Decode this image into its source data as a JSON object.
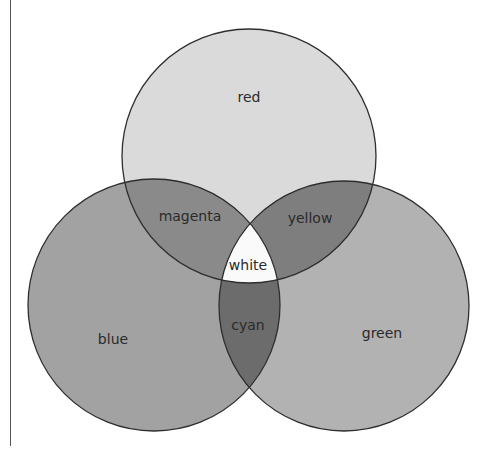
{
  "diagram": {
    "type": "venn",
    "circles": [
      {
        "name": "red",
        "label": "red",
        "cx": 249,
        "cy": 156,
        "r": 127,
        "fill": "#dadada"
      },
      {
        "name": "blue",
        "label": "blue",
        "cx": 154,
        "cy": 305,
        "r": 126,
        "fill": "#a2a2a2"
      },
      {
        "name": "green",
        "label": "green",
        "cx": 344,
        "cy": 306,
        "r": 125,
        "fill": "#b2b2b2"
      }
    ],
    "overlaps": {
      "red_blue": {
        "label": "magenta",
        "fill": "#8a8a8a"
      },
      "red_green": {
        "label": "yellow",
        "fill": "#7e7e7e"
      },
      "blue_green": {
        "label": "cyan",
        "fill": "#6c6c6c"
      },
      "all": {
        "label": "white",
        "fill": "#fafafa"
      }
    },
    "stroke": "#2e2e2e"
  },
  "labels": {
    "red": "red",
    "blue": "blue",
    "green": "green",
    "magenta": "magenta",
    "yellow": "yellow",
    "cyan": "cyan",
    "white": "white"
  }
}
